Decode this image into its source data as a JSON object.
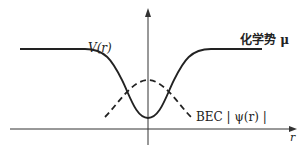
{
  "diagram": {
    "labels": {
      "potential": "V(r)",
      "chemical_potential": "化学势 μ",
      "bec": "BEC | ψ(r) |",
      "x_axis": "r"
    },
    "curves": [
      {
        "name": "V(r)",
        "style": "solid",
        "description": "potential well: flat plateau, dips to minimum at r=0"
      },
      {
        "name": "BEC |ψ(r)|",
        "style": "dashed",
        "description": "condensate wavefunction peaked at r=0"
      }
    ],
    "colors": {
      "line": "#222222",
      "background": "#ffffff"
    }
  }
}
